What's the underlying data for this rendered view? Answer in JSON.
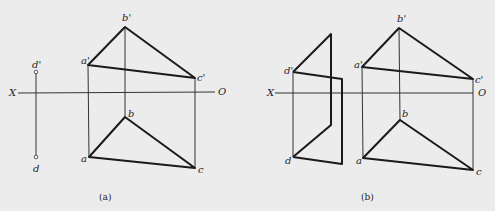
{
  "figure_a": {
    "caption": "(a)",
    "axis": {
      "x_label": "X",
      "o_label": "O"
    },
    "points": {
      "b_prime": "b'",
      "a_prime": "a'",
      "c_prime": "c'",
      "b": "b",
      "a": "a",
      "c": "c",
      "d_prime": "d'",
      "d": "d"
    }
  },
  "figure_b": {
    "caption": "(b)",
    "axis": {
      "x_label": "X",
      "o_label": "O"
    },
    "points": {
      "b_prime": "b'",
      "a_prime": "a'",
      "c_prime": "c'",
      "b": "b",
      "a": "a",
      "c": "c",
      "d_prime": "d'",
      "d": "d"
    }
  },
  "colors": {
    "background": "#ececec",
    "line": "#1a1a1a",
    "thin": "#333333"
  }
}
